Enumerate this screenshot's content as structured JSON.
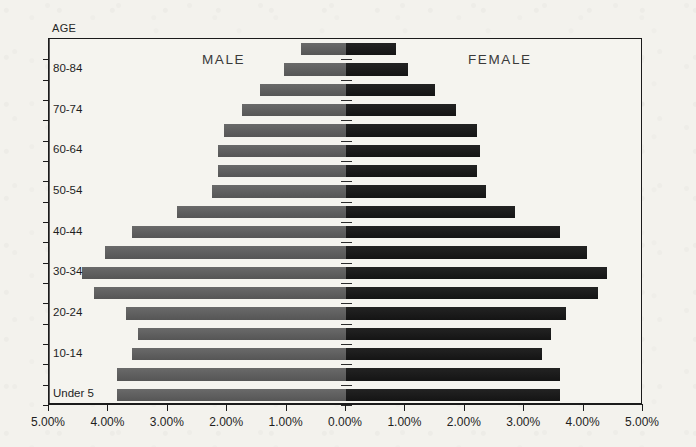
{
  "chart_data": {
    "type": "bar",
    "subtype": "population-pyramid",
    "title": "",
    "axis_caption": "AGE",
    "xlabel": "",
    "ylabel": "AGE",
    "grid": false,
    "legend_position": "in-plot",
    "xlim": [
      -5,
      5
    ],
    "x_display_absolute": true,
    "xticks": [
      -5,
      -4,
      -3,
      -2,
      -1,
      0,
      1,
      2,
      3,
      4,
      5
    ],
    "xticklabels": [
      "5.00%",
      "4.00%",
      "3.00%",
      "2.00%",
      "1.00%",
      "0.00%",
      "1.00%",
      "2.00%",
      "3.00%",
      "4.00%",
      "5.00%"
    ],
    "categories": [
      "85+",
      "80-84",
      "75-79",
      "70-74",
      "65-69",
      "60-64",
      "55-59",
      "50-54",
      "45-49",
      "40-44",
      "35-39",
      "30-34",
      "25-29",
      "20-24",
      "15-19",
      "10-14",
      "5-9",
      "Under 5"
    ],
    "visible_category_labels": [
      "80-84",
      "70-74",
      "60-64",
      "50-54",
      "40-44",
      "30-34",
      "20-24",
      "10-14",
      "Under 5"
    ],
    "series": [
      {
        "name": "MALE",
        "color": "#5b5b5b",
        "side": "left",
        "values": [
          0.75,
          1.05,
          1.45,
          1.75,
          2.05,
          2.15,
          2.15,
          2.25,
          2.85,
          3.6,
          4.05,
          4.45,
          4.25,
          3.7,
          3.5,
          3.6,
          3.85,
          3.85
        ]
      },
      {
        "name": "FEMALE",
        "color": "#151515",
        "side": "right",
        "values": [
          0.85,
          1.05,
          1.5,
          1.85,
          2.2,
          2.25,
          2.2,
          2.35,
          2.85,
          3.6,
          4.05,
          4.4,
          4.25,
          3.7,
          3.45,
          3.3,
          3.6,
          3.6
        ]
      }
    ]
  },
  "labels": {
    "age_caption": "AGE",
    "male": "MALE",
    "female": "FEMALE"
  },
  "colors": {
    "male_bar": "#5b5b5b",
    "female_bar": "#151515",
    "frame": "#1b1b1b",
    "background": "#f3f2ed"
  }
}
